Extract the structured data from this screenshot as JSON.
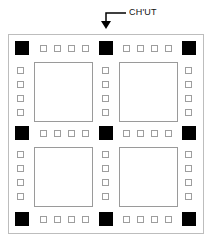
{
  "annotation": {
    "label": "CH'UT"
  },
  "layout": {
    "pad_cols": [
      15,
      99,
      182
    ],
    "pad_rows": [
      41,
      126,
      212
    ],
    "io_h_x": [
      [
        40,
        54,
        68,
        82
      ],
      [
        123,
        137,
        151,
        165
      ]
    ],
    "io_v_x": [
      17,
      102,
      185
    ],
    "io_v_y": [
      [
        67,
        81,
        95,
        109
      ],
      [
        151,
        165,
        179,
        193
      ]
    ],
    "dies": [
      {
        "x": 34,
        "y": 62
      },
      {
        "x": 119,
        "y": 62
      },
      {
        "x": 34,
        "y": 147
      },
      {
        "x": 119,
        "y": 147
      }
    ]
  },
  "colors": {
    "pad": "#000000",
    "io_border": "#9e9e9e",
    "die_border": "#9a9a9a",
    "frame": "#bdbdbd"
  }
}
